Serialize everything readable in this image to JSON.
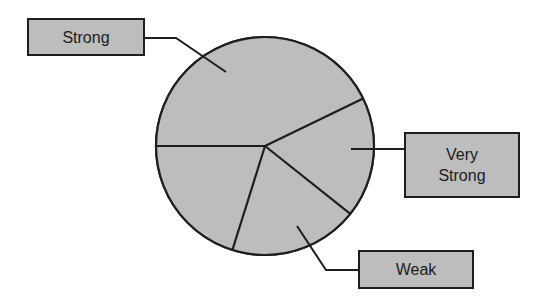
{
  "chart_data": {
    "type": "pie",
    "title": "",
    "legend": "none (callout labels)",
    "center": [
      265,
      146
    ],
    "radius": 109,
    "start_angle_deg": 180,
    "direction": "clockwise",
    "slices": [
      {
        "label": "Strong",
        "value": 42.8,
        "start": 180.0,
        "end": 334.2
      },
      {
        "label": "Very Strong",
        "value": 17.9,
        "start": 334.2,
        "end": 398.5
      },
      {
        "label": "Weak",
        "value": 19.1,
        "start": 38.5,
        "end": 107.4
      },
      {
        "label": "",
        "value": 20.2,
        "start": 107.4,
        "end": 180.0
      }
    ],
    "categories": [
      "Strong",
      "Very Strong",
      "Weak",
      ""
    ],
    "values": [
      42.8,
      17.9,
      19.1,
      20.2
    ],
    "colors": {
      "fill": "#bdbdbd",
      "stroke": "#1e1e1e"
    }
  },
  "callouts": [
    {
      "id": "strong",
      "text": "Strong",
      "box": [
        27,
        18,
        118,
        38
      ],
      "leader": [
        [
          145,
          38
        ],
        [
          176,
          38
        ],
        [
          226,
          72
        ]
      ]
    },
    {
      "id": "very-strong",
      "text": "Very\nStrong",
      "box": [
        404,
        132,
        116,
        66
      ],
      "leader": [
        [
          404,
          149
        ],
        [
          351,
          149
        ]
      ]
    },
    {
      "id": "weak",
      "text": "Weak",
      "box": [
        358,
        250,
        116,
        39
      ],
      "leader": [
        [
          358,
          270
        ],
        [
          326,
          270
        ],
        [
          297,
          226
        ]
      ]
    }
  ]
}
